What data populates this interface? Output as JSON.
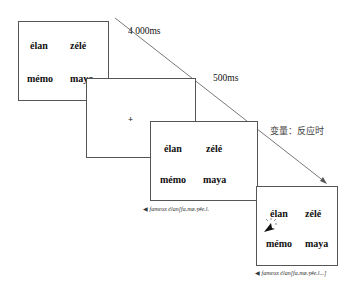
{
  "timing": {
    "first": "4 000ms",
    "second": "500ms"
  },
  "variable_label": "变量：反应时",
  "screens": [
    {
      "words": [
        "élan",
        "zélé",
        "mémo",
        "maya"
      ]
    },
    {
      "fixation": "+"
    },
    {
      "words": [
        "élan",
        "zélé",
        "mémo",
        "maya"
      ],
      "caption": "fameux élan[fa.mø.ʒ#e.l."
    },
    {
      "words": [
        "élan",
        "zélé",
        "mémo",
        "maya"
      ],
      "caption": "fameux élan[fa.mø.ʒ#e.l...]"
    }
  ]
}
